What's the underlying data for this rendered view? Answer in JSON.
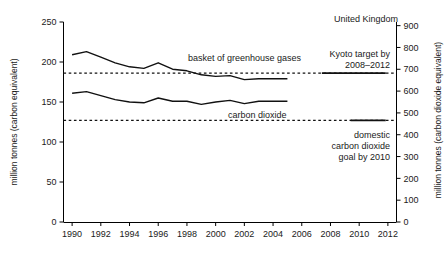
{
  "chart_data": {
    "type": "line",
    "title": "",
    "region_label": "United Kingdom",
    "xlabel": "",
    "ylabel": "million tonnes (carbon equivalent)",
    "y2label": "million tonnes (carbon dioxide equivalent)",
    "xlim": [
      1989.4,
      2012.6
    ],
    "ylim": [
      0,
      250
    ],
    "y2lim": [
      0,
      916.7
    ],
    "grid": false,
    "legend": "inline-annotations",
    "xticks": [
      1990,
      1992,
      1994,
      1996,
      1998,
      2000,
      2002,
      2004,
      2006,
      2008,
      2010,
      2012
    ],
    "xtick_labels": [
      "1990",
      "1992",
      "1994",
      "1996",
      "1998",
      "2000",
      "2002",
      "2004",
      "2006",
      "2008",
      "2010",
      "2012"
    ],
    "yticks": [
      0,
      50,
      100,
      150,
      200,
      250
    ],
    "ytick_labels": [
      "0",
      "50",
      "100",
      "150",
      "200",
      "250"
    ],
    "y2ticks": [
      0,
      100,
      200,
      300,
      400,
      500,
      600,
      700,
      800,
      900
    ],
    "y2tick_labels": [
      "0",
      "100",
      "200",
      "300",
      "400",
      "500",
      "600",
      "700",
      "800",
      "900"
    ],
    "x": [
      1990,
      1991,
      1992,
      1993,
      1994,
      1995,
      1996,
      1997,
      1998,
      1999,
      2000,
      2001,
      2002,
      2003,
      2004,
      2005
    ],
    "series": [
      {
        "name": "basket of greenhouse gases",
        "label": "basket of greenhouse gases",
        "color": "#111111",
        "style": "solid",
        "values": [
          209,
          213,
          206,
          199,
          194,
          192,
          199,
          191,
          189,
          184,
          182,
          183,
          178,
          179,
          179,
          179
        ]
      },
      {
        "name": "carbon dioxide",
        "label": "carbon dioxide",
        "color": "#111111",
        "style": "solid",
        "values": [
          161,
          163,
          158,
          153,
          150,
          149,
          155,
          151,
          151,
          147,
          150,
          152,
          148,
          151,
          151,
          151
        ]
      }
    ],
    "reference_lines": [
      {
        "name": "kyoto-target",
        "label_line1": "Kyoto target by",
        "label_line2": "2008–2012",
        "value": 186,
        "value_right_axis": 682,
        "style": "dashed-across-with-solid-marker",
        "marker_span_years": [
          2008,
          2012
        ]
      },
      {
        "name": "domestic-co2-goal",
        "label_line1": "domestic",
        "label_line2": "carbon dioxide",
        "label_line3": "goal by 2010",
        "value": 127,
        "value_right_axis": 466,
        "style": "dashed-across-with-solid-marker",
        "marker_span_years": [
          2010,
          2012
        ]
      }
    ],
    "annotations": [
      {
        "name": "region-label",
        "text": "United Kingdom"
      },
      {
        "name": "basket-label",
        "text": "basket of greenhouse gases"
      },
      {
        "name": "co2-label",
        "text": "carbon dioxide"
      }
    ]
  }
}
